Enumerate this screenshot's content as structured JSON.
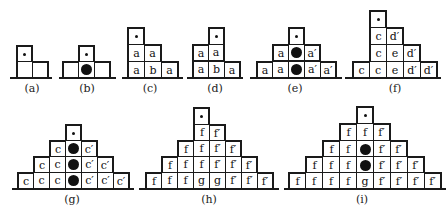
{
  "legend": {
    "small_dot": "marker-dot",
    "large_disc": "filled-disc"
  },
  "figures": [
    {
      "id": "a",
      "label": "(a)",
      "cell": 16,
      "baseline": {
        "x1": 10,
        "x2": 52,
        "y": 77
      },
      "label_pos": {
        "x": 32,
        "y": 82
      },
      "cells": [
        {
          "x": 16,
          "y": 45,
          "t": "dot"
        },
        {
          "x": 16,
          "y": 61,
          "t": ""
        },
        {
          "x": 32,
          "y": 61,
          "t": ""
        }
      ]
    },
    {
      "id": "b",
      "label": "(b)",
      "cell": 16,
      "baseline": {
        "x1": 59,
        "x2": 116,
        "y": 77
      },
      "label_pos": {
        "x": 87,
        "y": 82
      },
      "cells": [
        {
          "x": 78,
          "y": 45,
          "t": "dot"
        },
        {
          "x": 62,
          "y": 61,
          "t": ""
        },
        {
          "x": 78,
          "y": 61,
          "t": "disc"
        },
        {
          "x": 94,
          "y": 61,
          "t": ""
        }
      ]
    },
    {
      "id": "c",
      "label": "(c)",
      "cell": 17,
      "baseline": {
        "x1": 122,
        "x2": 183,
        "y": 77
      },
      "label_pos": {
        "x": 150,
        "y": 82
      },
      "cells": [
        {
          "x": 127,
          "y": 27,
          "t": "dot"
        },
        {
          "x": 127,
          "y": 44,
          "t": "a"
        },
        {
          "x": 144,
          "y": 44,
          "t": "a"
        },
        {
          "x": 127,
          "y": 61,
          "t": "a"
        },
        {
          "x": 144,
          "y": 61,
          "t": "b"
        },
        {
          "x": 161,
          "y": 61,
          "t": "a"
        }
      ]
    },
    {
      "id": "d",
      "label": "(d)",
      "cell": 16,
      "baseline": {
        "x1": 187,
        "x2": 243,
        "y": 77
      },
      "label_pos": {
        "x": 215,
        "y": 82
      },
      "cells": [
        {
          "x": 208,
          "y": 27,
          "t": "dot"
        },
        {
          "x": 192,
          "y": 44,
          "t": "a"
        },
        {
          "x": 208,
          "y": 44,
          "t": "a"
        },
        {
          "x": 192,
          "y": 61,
          "t": "a"
        },
        {
          "x": 208,
          "y": 61,
          "t": "b"
        },
        {
          "x": 224,
          "y": 61,
          "t": "a"
        }
      ]
    },
    {
      "id": "e",
      "label": "(e)",
      "cell": 16,
      "baseline": {
        "x1": 250,
        "x2": 342,
        "y": 77
      },
      "label_pos": {
        "x": 295,
        "y": 82
      },
      "cells": [
        {
          "x": 288,
          "y": 27,
          "t": "dot"
        },
        {
          "x": 272,
          "y": 44,
          "t": "a"
        },
        {
          "x": 288,
          "y": 44,
          "t": "disc"
        },
        {
          "x": 304,
          "y": 44,
          "t": "a′"
        },
        {
          "x": 256,
          "y": 61,
          "t": "a"
        },
        {
          "x": 272,
          "y": 61,
          "t": "a"
        },
        {
          "x": 288,
          "y": 61,
          "t": "disc"
        },
        {
          "x": 304,
          "y": 61,
          "t": "a′"
        },
        {
          "x": 320,
          "y": 61,
          "t": "a′"
        }
      ]
    },
    {
      "id": "f",
      "label": "(f)",
      "cell": 17,
      "baseline": {
        "x1": 345,
        "x2": 441,
        "y": 77
      },
      "label_pos": {
        "x": 395,
        "y": 82
      },
      "cells": [
        {
          "x": 369,
          "y": 10,
          "t": "dot"
        },
        {
          "x": 369,
          "y": 27,
          "t": "c"
        },
        {
          "x": 386,
          "y": 27,
          "t": "d′"
        },
        {
          "x": 369,
          "y": 44,
          "t": "c"
        },
        {
          "x": 386,
          "y": 44,
          "t": "e"
        },
        {
          "x": 403,
          "y": 44,
          "t": "d′"
        },
        {
          "x": 352,
          "y": 61,
          "t": "c"
        },
        {
          "x": 369,
          "y": 61,
          "t": "c"
        },
        {
          "x": 386,
          "y": 61,
          "t": "e"
        },
        {
          "x": 403,
          "y": 61,
          "t": "d′"
        },
        {
          "x": 420,
          "y": 61,
          "t": "d′"
        }
      ]
    },
    {
      "id": "g",
      "label": "(g)",
      "cell": 16,
      "baseline": {
        "x1": 12,
        "x2": 134,
        "y": 188
      },
      "label_pos": {
        "x": 72,
        "y": 193
      },
      "cells": [
        {
          "x": 65,
          "y": 124,
          "t": "dot"
        },
        {
          "x": 49,
          "y": 140,
          "t": "c"
        },
        {
          "x": 65,
          "y": 140,
          "t": "disc"
        },
        {
          "x": 81,
          "y": 140,
          "t": "c′"
        },
        {
          "x": 33,
          "y": 156,
          "t": "c"
        },
        {
          "x": 49,
          "y": 156,
          "t": "c"
        },
        {
          "x": 65,
          "y": 156,
          "t": "disc"
        },
        {
          "x": 81,
          "y": 156,
          "t": "c′"
        },
        {
          "x": 97,
          "y": 156,
          "t": "c′"
        },
        {
          "x": 17,
          "y": 172,
          "t": "c"
        },
        {
          "x": 33,
          "y": 172,
          "t": "c"
        },
        {
          "x": 49,
          "y": 172,
          "t": "c"
        },
        {
          "x": 65,
          "y": 172,
          "t": "disc"
        },
        {
          "x": 81,
          "y": 172,
          "t": "c′"
        },
        {
          "x": 97,
          "y": 172,
          "t": "c′"
        },
        {
          "x": 113,
          "y": 172,
          "t": "c′"
        }
      ]
    },
    {
      "id": "h",
      "label": "(h)",
      "cell": 16,
      "baseline": {
        "x1": 139,
        "x2": 279,
        "y": 188
      },
      "label_pos": {
        "x": 209,
        "y": 193
      },
      "cells": [
        {
          "x": 193,
          "y": 107,
          "t": "dot"
        },
        {
          "x": 193,
          "y": 124,
          "t": "f"
        },
        {
          "x": 209,
          "y": 124,
          "t": "f′"
        },
        {
          "x": 177,
          "y": 140,
          "t": "f"
        },
        {
          "x": 193,
          "y": 140,
          "t": "f"
        },
        {
          "x": 209,
          "y": 140,
          "t": "f′"
        },
        {
          "x": 225,
          "y": 140,
          "t": "f′"
        },
        {
          "x": 161,
          "y": 156,
          "t": "f"
        },
        {
          "x": 177,
          "y": 156,
          "t": "f"
        },
        {
          "x": 193,
          "y": 156,
          "t": "f"
        },
        {
          "x": 209,
          "y": 156,
          "t": "f′"
        },
        {
          "x": 225,
          "y": 156,
          "t": "f′"
        },
        {
          "x": 241,
          "y": 156,
          "t": "f′"
        },
        {
          "x": 145,
          "y": 172,
          "t": "f"
        },
        {
          "x": 161,
          "y": 172,
          "t": "f"
        },
        {
          "x": 177,
          "y": 172,
          "t": "f"
        },
        {
          "x": 193,
          "y": 172,
          "t": "g"
        },
        {
          "x": 209,
          "y": 172,
          "t": "g"
        },
        {
          "x": 225,
          "y": 172,
          "t": "f′"
        },
        {
          "x": 241,
          "y": 172,
          "t": "f′"
        },
        {
          "x": 257,
          "y": 172,
          "t": "f′"
        }
      ]
    },
    {
      "id": "i",
      "label": "(i)",
      "cell": 17,
      "baseline": {
        "x1": 284,
        "x2": 446,
        "y": 188
      },
      "label_pos": {
        "x": 362,
        "y": 193
      },
      "cells": [
        {
          "x": 356,
          "y": 106,
          "t": "dot"
        },
        {
          "x": 339,
          "y": 123,
          "t": "f"
        },
        {
          "x": 356,
          "y": 123,
          "t": "f"
        },
        {
          "x": 373,
          "y": 123,
          "t": "f′"
        },
        {
          "x": 322,
          "y": 140,
          "t": "f"
        },
        {
          "x": 339,
          "y": 140,
          "t": "f"
        },
        {
          "x": 356,
          "y": 140,
          "t": "disc"
        },
        {
          "x": 373,
          "y": 140,
          "t": "f′"
        },
        {
          "x": 390,
          "y": 140,
          "t": "f′"
        },
        {
          "x": 305,
          "y": 156,
          "t": "f"
        },
        {
          "x": 322,
          "y": 156,
          "t": "f"
        },
        {
          "x": 339,
          "y": 156,
          "t": "f"
        },
        {
          "x": 356,
          "y": 156,
          "t": "disc"
        },
        {
          "x": 373,
          "y": 156,
          "t": "f′"
        },
        {
          "x": 390,
          "y": 156,
          "t": "f′"
        },
        {
          "x": 407,
          "y": 156,
          "t": "f′"
        },
        {
          "x": 288,
          "y": 172,
          "t": "f"
        },
        {
          "x": 305,
          "y": 172,
          "t": "f"
        },
        {
          "x": 322,
          "y": 172,
          "t": "f"
        },
        {
          "x": 339,
          "y": 172,
          "t": "f"
        },
        {
          "x": 356,
          "y": 172,
          "t": "g"
        },
        {
          "x": 373,
          "y": 172,
          "t": "f′"
        },
        {
          "x": 390,
          "y": 172,
          "t": "f′"
        },
        {
          "x": 407,
          "y": 172,
          "t": "f′"
        },
        {
          "x": 424,
          "y": 172,
          "t": "f′"
        }
      ]
    }
  ]
}
